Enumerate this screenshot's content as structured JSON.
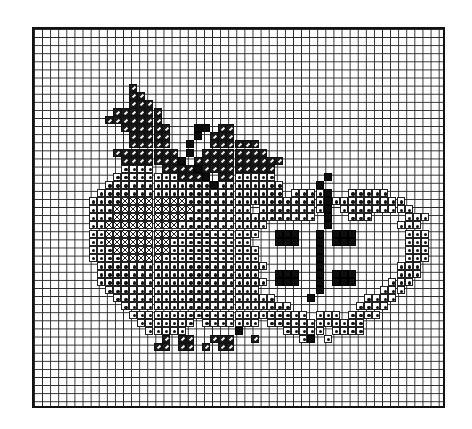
{
  "chart": {
    "grid": {
      "cols": 51,
      "rows": 47,
      "cell_px": 8.1,
      "origin": [
        32,
        27
      ]
    },
    "legend": {
      ".": "empty",
      "o": "dotted stitch (apple)",
      "x": "cross-hatch stitch (highlight)",
      "/": "diagonal hatched stitch (leaf)",
      "#": "solid black stitch (stem / seeds)"
    },
    "colors": {
      "grid": "#222222",
      "ink": "#111111",
      "paper": "#ffffff"
    },
    "rows": [
      "...................................................",
      "...................................................",
      "...................................................",
      "...................................................",
      "...................................................",
      "...................................................",
      "...................................................",
      "............/......................................",
      "............//.....................................",
      "............///....................................",
      "..........//////...................................",
      ".........///////...................................",
      "...........//////...##.//..........................",
      "............/////...#.///..........................",
      "............/////..#..//////.......................",
      "..........////////.#.////////......................",
      "...........///////#.///////////....................",
      "...........oooo.////#/////////.....................",
      "..........oooooooo///#.//ooooo......#..............",
      ".........ooooooooooooo#oooooooo....#...............",
      "........ooooooooooooooooooooooo.oooo#..ooooo.......",
      ".......ooooxxxxxxxxooooooooooooooooo#ooooooooo.....",
      ".......oooxxxxxxxxxxooooooo.oooooooo#.ooooooooo....",
      ".......oooxxxxxxxxxoooooooooooooooo.#..ooo....ooo..",
      ".......ooxxxxxxxxxooooooooooo.......#........ooo...",
      ".......ooxxxxxxxxxoooooooooo..###..#.###......ooo..",
      ".......ooxxxxxxxxoooooooooo...###..#.###......ooo..",
      ".......oooxxxxxxxooooooooooo.......#..........ooo..",
      ".......ooooxxxxxoooooooooooo.......#..........ooo..",
      "........ooooooooooooooooooooo......#.........ooo...",
      "........oooooooooooooooooooo..###..#.###.....ooo...",
      "........ooooooooooooooooooooo.###..#.###....ooo....",
      ".........ooooooooooooooooooo.......#.......ooo.....",
      "..........oooooooooooooooooooo....#......oooo......",
      "...........ooooooooooooooooooooo........oooo.......",
      "............oooooooooooooooooooooo.ooo.oooo........",
      ".............ooooooo.ooooooo.oooooooooooo..........",
      "..............ooooo......#.....ooooo.oooo..........",
      "...............././/..///../.....o#.o..............",
      "...............//.//././/..........................",
      "...................................................",
      "...................................................",
      "...................................................",
      "...................................................",
      "...................................................",
      "...................................................",
      "..................................................."
    ]
  }
}
